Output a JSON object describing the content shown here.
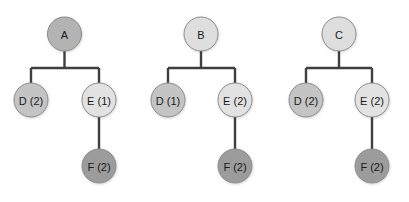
{
  "diagram": {
    "type": "tree-set",
    "colors": {
      "edge": "#3f3f3f",
      "node_stroke": "#8a8a8a",
      "root_A": "#b3b3b3",
      "root_light": "#dedede",
      "D": "#c4c4c4",
      "E": "#e2e2e2",
      "F": "#9c9c9c"
    },
    "trees": [
      {
        "root": {
          "label": "A",
          "x": 64.5,
          "y": 34,
          "fill": "#b3b3b3"
        },
        "bar_y": 68,
        "left": {
          "label": "D (2)",
          "x": 31,
          "y": 100,
          "fill": "#c4c4c4"
        },
        "right": {
          "label": "E (1)",
          "x": 99,
          "y": 100,
          "fill": "#e2e2e2"
        },
        "child": {
          "label": "F (2)",
          "x": 99,
          "y": 166,
          "fill": "#9c9c9c"
        }
      },
      {
        "root": {
          "label": "B",
          "x": 201,
          "y": 34,
          "fill": "#dedede"
        },
        "bar_y": 68,
        "left": {
          "label": "D (1)",
          "x": 168,
          "y": 100,
          "fill": "#c4c4c4"
        },
        "right": {
          "label": "E (2)",
          "x": 235,
          "y": 100,
          "fill": "#e2e2e2"
        },
        "child": {
          "label": "F (2)",
          "x": 235,
          "y": 166,
          "fill": "#9c9c9c"
        }
      },
      {
        "root": {
          "label": "C",
          "x": 339,
          "y": 34,
          "fill": "#dedede"
        },
        "bar_y": 68,
        "left": {
          "label": "D (2)",
          "x": 306,
          "y": 100,
          "fill": "#c4c4c4"
        },
        "right": {
          "label": "E (2)",
          "x": 372,
          "y": 100,
          "fill": "#e2e2e2"
        },
        "child": {
          "label": "F (2)",
          "x": 372,
          "y": 166,
          "fill": "#9c9c9c"
        }
      }
    ],
    "node_radius": 17
  }
}
